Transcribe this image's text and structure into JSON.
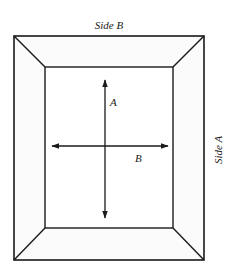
{
  "diagram": {
    "title_top": "Side B",
    "title_right": "Side A",
    "arrow_vertical_label": "A",
    "arrow_horizontal_label": "B",
    "colors": {
      "line": "#1a1a1a",
      "face": "#fbfbfb",
      "background": "#ffffff"
    }
  }
}
